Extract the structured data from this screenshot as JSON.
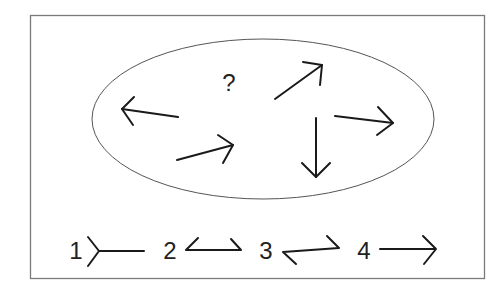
{
  "figure": {
    "question_mark": "?",
    "frame_color": "#7a7a7a",
    "ellipse_color": "#555555",
    "stroke_color": "#1a1a1a"
  },
  "ellipse_arrows": [
    {
      "name": "arrow-left",
      "direction": "left (slightly up)"
    },
    {
      "name": "arrow-lower-right",
      "direction": "up-right (shallow)"
    },
    {
      "name": "arrow-upper-right",
      "direction": "up-right (steep)"
    },
    {
      "name": "arrow-down",
      "direction": "down"
    },
    {
      "name": "arrow-right",
      "direction": "right (slightly down)"
    }
  ],
  "options": [
    {
      "label": "1",
      "shape": "fletching-tail-only line"
    },
    {
      "label": "2",
      "shape": "line with both barbs up, open ends"
    },
    {
      "label": "3",
      "shape": "line with barb down-left and barb up-right"
    },
    {
      "label": "4",
      "shape": "standard right arrow"
    }
  ]
}
